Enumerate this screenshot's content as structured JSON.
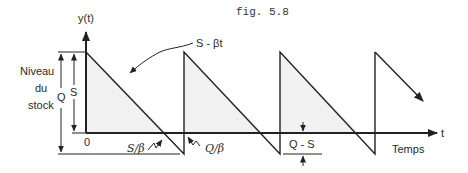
{
  "figure": {
    "title": "fig. 5.8",
    "y_axis_label": "y(t)",
    "x_axis_label": "t",
    "x_axis_caption": "Temps",
    "y_caption_lines": [
      "Niveau",
      "du",
      "stock"
    ],
    "origin_label": "0",
    "slope_label": "S - βt",
    "dim_S": "S",
    "dim_Q": "Q",
    "tick_S_over_beta": "S/β",
    "tick_Q_over_beta": "Q/β",
    "shortage_label": "Q - S"
  },
  "colors": {
    "ink": "#222222",
    "fill": "#f1f1f1"
  }
}
